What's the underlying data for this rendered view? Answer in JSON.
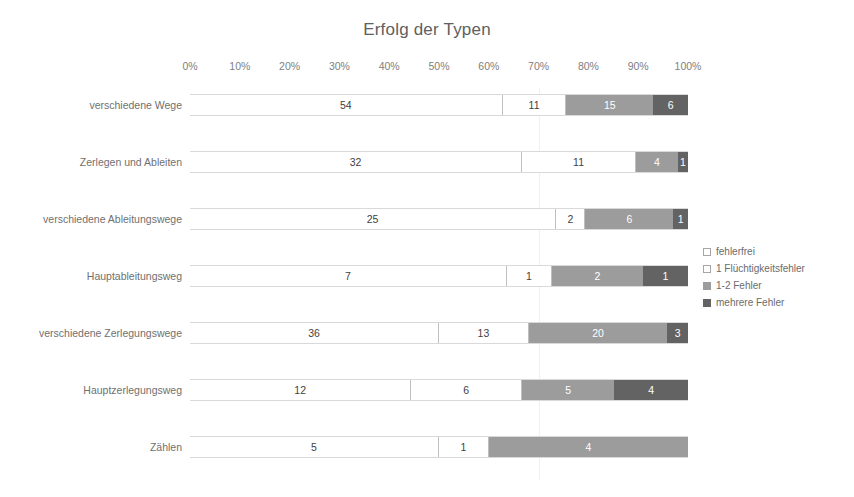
{
  "chart_data": {
    "type": "bar",
    "subtype": "stacked-horizontal-100percent",
    "title": "Erfolg der Typen",
    "xlabel": "",
    "ylabel": "",
    "xlim": [
      0,
      100
    ],
    "xticks": [
      "0%",
      "10%",
      "20%",
      "30%",
      "40%",
      "50%",
      "60%",
      "70%",
      "80%",
      "90%",
      "100%"
    ],
    "grid": false,
    "legend_position": "right",
    "categories": [
      "verschiedene Wege",
      "Zerlegen und Ableiten",
      "verschiedene Ableitungswege",
      "Hauptableitungsweg",
      "verschiedene Zerlegungswege",
      "Hauptzerlegungsweg",
      "Zählen"
    ],
    "series": [
      {
        "name": "fehlerfrei",
        "values": [
          54,
          32,
          25,
          7,
          36,
          12,
          5
        ]
      },
      {
        "name": "1 Flüchtigkeitsfehler",
        "values": [
          11,
          11,
          2,
          1,
          13,
          6,
          1
        ]
      },
      {
        "name": "1-2 Fehler",
        "values": [
          15,
          4,
          6,
          2,
          20,
          5,
          4
        ]
      },
      {
        "name": "mehrere Fehler",
        "values": [
          6,
          1,
          1,
          1,
          3,
          4,
          0
        ]
      }
    ],
    "totals": [
      86,
      48,
      34,
      11,
      72,
      27,
      10
    ],
    "colors": {
      "fehlerfrei": "#ffffff",
      "1 Flüchtigkeitsfehler": "#ffffff",
      "1-2 Fehler": "#9c9c9c",
      "mehrere Fehler": "#636363",
      "segment_border": "#bfbfbf",
      "bar_outline": "#d9d9d9",
      "text": "#595959",
      "axis_text": "#808080"
    }
  },
  "legend": {
    "items": [
      {
        "label": "fehlerfrei",
        "swatch": "#ffffff"
      },
      {
        "label": "1 Flüchtigkeitsfehler",
        "swatch": "#ffffff"
      },
      {
        "label": "1-2 Fehler",
        "swatch": "#9c9c9c"
      },
      {
        "label": "mehrere Fehler",
        "swatch": "#636363"
      }
    ]
  }
}
